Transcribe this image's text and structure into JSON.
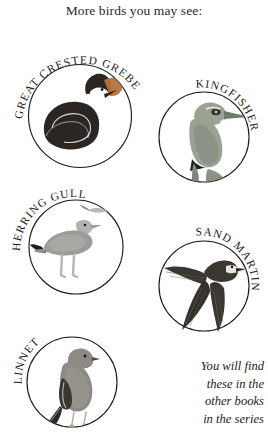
{
  "page": {
    "title": "More birds you may see:",
    "background_color": "#ffffff",
    "ink_color": "#1d1d1d"
  },
  "medallions": [
    {
      "id": "great-crested-grebe",
      "label": "GREAT CRESTED GREBE",
      "label_arc": "top-left",
      "body_color": "#2b2623",
      "accent_color": "#b5703a",
      "highlight_color": "#ffffff"
    },
    {
      "id": "kingfisher",
      "label": "KINGFISHER",
      "label_arc": "top-right",
      "body_color": "#9aa294",
      "accent_color": "#6f7a6b",
      "highlight_color": "#ffffff"
    },
    {
      "id": "herring-gull",
      "label": "HERRING GULL",
      "label_arc": "top-left",
      "body_color": "#9b9b99",
      "accent_color": "#1d1d1d",
      "highlight_color": "#cfcfcb"
    },
    {
      "id": "sand-martin",
      "label": "SAND MARTIN",
      "label_arc": "top-right",
      "body_color": "#3a3632",
      "accent_color": "#2a2724",
      "highlight_color": "#e8e4dd"
    },
    {
      "id": "linnet",
      "label": "LINNET",
      "label_arc": "top-left",
      "body_color": "#8d8a84",
      "accent_color": "#3a3732",
      "highlight_color": "#c9c5bd"
    }
  ],
  "series_note": {
    "line1": "You will find",
    "line2": "these in the",
    "line3": "other books",
    "line4": "in the series"
  }
}
